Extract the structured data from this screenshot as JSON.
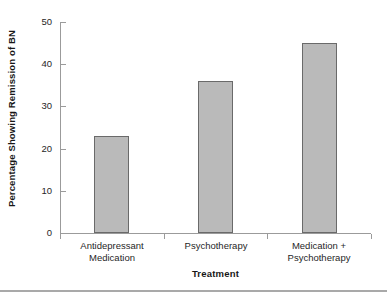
{
  "chart_data": {
    "type": "bar",
    "title": "",
    "subtitle": "",
    "xlabel": "Treatment",
    "ylabel": "Percentage Showing Remission of BN",
    "categories": [
      "Antidepressant Medication",
      "Psychotherapy",
      "Medication + Psychotherapy"
    ],
    "category_lines": [
      [
        "Antidepressant",
        "Medication"
      ],
      [
        "Psychotherapy",
        ""
      ],
      [
        "Medication +",
        "Psychotherapy"
      ]
    ],
    "values": [
      23,
      36,
      45
    ],
    "ylim": [
      0,
      50
    ],
    "ytick_labels": [
      "0",
      "10",
      "20",
      "30",
      "40",
      "50"
    ],
    "ytick_values": [
      0,
      10,
      20,
      30,
      40,
      50
    ],
    "grid": false,
    "legend": "none",
    "bar_fill_color": "#bababa",
    "bar_edge_color": "#6a6a6a",
    "axis_color": "#9b9b9b",
    "text_color": "#1c1c1c"
  }
}
